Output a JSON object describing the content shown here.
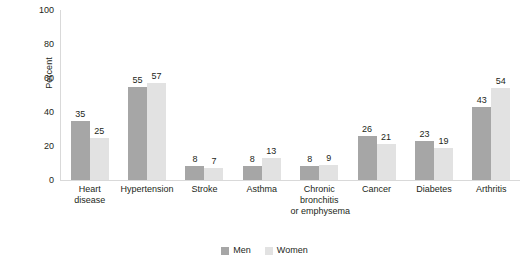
{
  "chart_data": {
    "type": "bar",
    "title": "",
    "subtitle": "",
    "xlabel": "",
    "ylabel": "Percent",
    "ylim": [
      0,
      100
    ],
    "yticks": [
      0,
      20,
      40,
      60,
      80,
      100
    ],
    "grid": false,
    "legend_position": "bottom-center",
    "value_labels": true,
    "categories": [
      "Heart disease",
      "Hypertension",
      "Stroke",
      "Asthma",
      "Chronic bronchitis or emphysema",
      "Cancer",
      "Diabetes",
      "Arthritis"
    ],
    "category_lines": [
      [
        "Heart",
        "disease"
      ],
      [
        "Hypertension"
      ],
      [
        "Stroke"
      ],
      [
        "Asthma"
      ],
      [
        "Chronic",
        "bronchitis",
        "or emphysema"
      ],
      [
        "Cancer"
      ],
      [
        "Diabetes"
      ],
      [
        "Arthritis"
      ]
    ],
    "series": [
      {
        "name": "Men",
        "color": "#a6a6a6",
        "values": [
          35,
          55,
          8,
          8,
          8,
          26,
          23,
          43
        ]
      },
      {
        "name": "Women",
        "color": "#e2e2e2",
        "values": [
          25,
          57,
          7,
          13,
          9,
          21,
          19,
          54
        ]
      }
    ]
  },
  "axis": {
    "y_title": "Percent",
    "y_tick_labels": [
      "100",
      "80",
      "60",
      "40",
      "20",
      "0"
    ],
    "axis_color": "#d9d9d9"
  },
  "legend": {
    "items": [
      {
        "label": "Men",
        "color": "#a6a6a6"
      },
      {
        "label": "Women",
        "color": "#e2e2e2"
      }
    ]
  }
}
